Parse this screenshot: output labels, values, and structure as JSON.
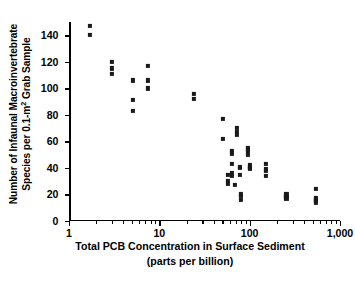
{
  "figure": {
    "y_axis_title_line1": "Number of Infaunal Macroinvertebrate",
    "y_axis_title_line2_pre": "Species per 0.1-m",
    "y_axis_title_line2_sup": "2",
    "y_axis_title_line2_post": " Grab Sample",
    "x_axis_title_line1": "Total PCB Concentration in Surface Sediment",
    "x_axis_title_line2": "(parts per billion)",
    "marker_color": "#1a1a1a",
    "axis_color": "#000000",
    "background_color": "#ffffff"
  },
  "chart_data": {
    "type": "scatter",
    "title": "",
    "xlabel": "Total PCB Concentration in Surface Sediment (parts per billion)",
    "ylabel": "Number of Infaunal Macroinvertebrate Species per 0.1-m2 Grab Sample",
    "xscale": "log",
    "yscale": "linear",
    "xlim": [
      1,
      1000
    ],
    "ylim": [
      0,
      150
    ],
    "grid": false,
    "legend": null,
    "xticks": [
      1,
      10,
      100,
      1000
    ],
    "xtick_labels": [
      "1",
      "10",
      "100",
      "1,000"
    ],
    "yticks": [
      0,
      20,
      40,
      60,
      80,
      100,
      120,
      140
    ],
    "ytick_labels": [
      "0",
      "20",
      "40",
      "60",
      "80",
      "100",
      "120",
      "140"
    ],
    "series": [
      {
        "name": "Grab samples",
        "marker": "square",
        "points": [
          [
            1.7,
            147
          ],
          [
            1.7,
            140
          ],
          [
            3.0,
            120
          ],
          [
            3.0,
            115
          ],
          [
            3.0,
            111
          ],
          [
            5.1,
            106
          ],
          [
            5.1,
            91
          ],
          [
            5.1,
            83
          ],
          [
            7.5,
            117
          ],
          [
            7.5,
            106
          ],
          [
            7.5,
            100
          ],
          [
            24,
            96
          ],
          [
            24,
            92
          ],
          [
            51,
            77
          ],
          [
            51,
            62
          ],
          [
            57,
            35
          ],
          [
            57,
            30
          ],
          [
            57,
            28
          ],
          [
            64,
            53
          ],
          [
            64,
            51
          ],
          [
            64,
            43
          ],
          [
            64,
            36
          ],
          [
            64,
            34
          ],
          [
            68,
            27
          ],
          [
            72,
            70
          ],
          [
            72,
            67
          ],
          [
            72,
            65
          ],
          [
            78,
            41
          ],
          [
            78,
            40
          ],
          [
            78,
            35
          ],
          [
            80,
            20
          ],
          [
            80,
            19
          ],
          [
            80,
            16
          ],
          [
            96,
            55
          ],
          [
            96,
            54
          ],
          [
            96,
            52
          ],
          [
            96,
            50
          ],
          [
            100,
            42
          ],
          [
            100,
            41
          ],
          [
            100,
            40
          ],
          [
            100,
            39
          ],
          [
            150,
            43
          ],
          [
            150,
            39
          ],
          [
            150,
            38
          ],
          [
            150,
            34
          ],
          [
            255,
            20
          ],
          [
            255,
            18
          ],
          [
            255,
            17
          ],
          [
            540,
            24
          ],
          [
            540,
            17
          ],
          [
            540,
            16
          ],
          [
            540,
            15
          ],
          [
            540,
            14
          ]
        ]
      }
    ]
  }
}
